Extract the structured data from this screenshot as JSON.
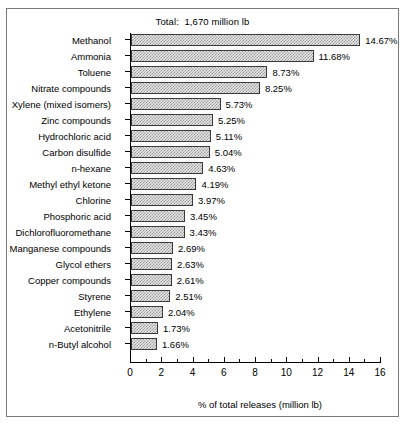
{
  "figure": {
    "title": "Total:  1,670 million lb",
    "frame_color": "#7a7a7a",
    "bar_fill": "#c8c8c8",
    "bar_border": "#3a3a3a"
  },
  "chart_data": {
    "type": "bar",
    "orientation": "horizontal",
    "title": "Total:  1,670 million lb",
    "xlabel": "% of total releases (million lb)",
    "ylabel": "",
    "xlim": [
      0,
      16
    ],
    "xticks": [
      0,
      2,
      4,
      6,
      8,
      10,
      12,
      14,
      16
    ],
    "xtick_labels": [
      "0",
      "2",
      "4",
      "6",
      "8",
      "10",
      "12",
      "14",
      "16"
    ],
    "minor_ticks": [
      1,
      3,
      5,
      7,
      9,
      11,
      13,
      15
    ],
    "grid": false,
    "legend": null,
    "value_suffix": "%",
    "categories": [
      "Methanol",
      "Ammonia",
      "Toluene",
      "Nitrate compounds",
      "Xylene (mixed isomers)",
      "Zinc compounds",
      "Hydrochloric acid",
      "Carbon disulfide",
      "n-hexane",
      "Methyl ethyl ketone",
      "Chlorine",
      "Phosphoric acid",
      "Dichlorofluoromethane",
      "Manganese compounds",
      "Glycol ethers",
      "Copper compounds",
      "Styrene",
      "Ethylene",
      "Acetonitrile",
      "n-Butyl alcohol"
    ],
    "values": [
      14.67,
      11.68,
      8.73,
      8.25,
      5.73,
      5.25,
      5.11,
      5.04,
      4.63,
      4.19,
      3.97,
      3.45,
      3.43,
      2.69,
      2.63,
      2.61,
      2.51,
      2.04,
      1.73,
      1.66
    ],
    "value_labels": [
      "14.67%",
      "11.68%",
      "8.73%",
      "8.25%",
      "5.73%",
      "5.25%",
      "5.11%",
      "5.04%",
      "4.63%",
      "4.19%",
      "3.97%",
      "3.45%",
      "3.43%",
      "2.69%",
      "2.63%",
      "2.61%",
      "2.51%",
      "2.04%",
      "1.73%",
      "1.66%"
    ]
  }
}
